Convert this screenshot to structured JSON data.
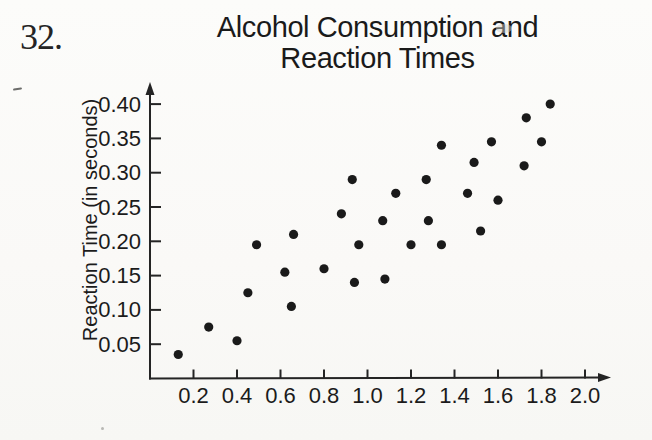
{
  "page": {
    "problem_number": "32.",
    "background": "#faf9f7"
  },
  "chart_data": {
    "type": "scatter",
    "title": "Alcohol Consumption and Reaction Times",
    "title_lines": [
      "Alcohol Consumption and",
      "Reaction Times"
    ],
    "xlabel": "",
    "ylabel": "Reaction Time (in seconds)",
    "xlim": [
      0,
      2.1
    ],
    "ylim": [
      0,
      0.43
    ],
    "xticks": [
      0.2,
      0.4,
      0.6,
      0.8,
      1.0,
      1.2,
      1.4,
      1.6,
      1.8,
      2.0
    ],
    "xtick_labels": [
      "0.2",
      "0.4",
      "0.6",
      "0.8",
      "1.0",
      "1.2",
      "1.4",
      "1.6",
      "1.8",
      "2.0"
    ],
    "yticks": [
      0.05,
      0.1,
      0.15,
      0.2,
      0.25,
      0.3,
      0.35,
      0.4
    ],
    "ytick_labels": [
      "0.05",
      "0.10",
      "0.15",
      "0.20",
      "0.25",
      "0.30",
      "0.35",
      "0.40"
    ],
    "grid": false,
    "legend": false,
    "point_color": "#1a1a1a",
    "axis_color": "#242424",
    "text_color": "#1b1b1b",
    "points": [
      [
        0.13,
        0.035
      ],
      [
        0.27,
        0.075
      ],
      [
        0.4,
        0.055
      ],
      [
        0.45,
        0.125
      ],
      [
        0.49,
        0.195
      ],
      [
        0.62,
        0.155
      ],
      [
        0.65,
        0.105
      ],
      [
        0.66,
        0.21
      ],
      [
        0.8,
        0.16
      ],
      [
        0.88,
        0.24
      ],
      [
        0.93,
        0.29
      ],
      [
        0.94,
        0.14
      ],
      [
        0.96,
        0.195
      ],
      [
        1.07,
        0.23
      ],
      [
        1.08,
        0.145
      ],
      [
        1.13,
        0.27
      ],
      [
        1.2,
        0.195
      ],
      [
        1.27,
        0.29
      ],
      [
        1.28,
        0.23
      ],
      [
        1.34,
        0.195
      ],
      [
        1.34,
        0.34
      ],
      [
        1.46,
        0.27
      ],
      [
        1.49,
        0.315
      ],
      [
        1.52,
        0.215
      ],
      [
        1.57,
        0.345
      ],
      [
        1.6,
        0.26
      ],
      [
        1.72,
        0.31
      ],
      [
        1.73,
        0.38
      ],
      [
        1.8,
        0.345
      ],
      [
        1.84,
        0.4
      ]
    ]
  }
}
